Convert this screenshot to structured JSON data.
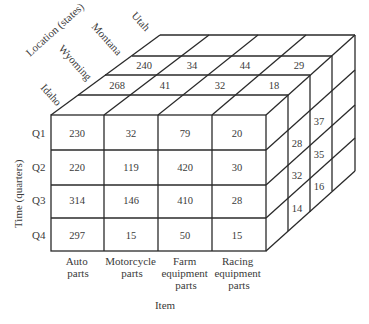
{
  "diagram": {
    "type": "data-cube",
    "axes": {
      "location": {
        "title": "Location (states)",
        "labels": [
          "Idaho",
          "Wyoming",
          "Montana",
          "Utah"
        ]
      },
      "time": {
        "title": "Time (quarters)",
        "labels": [
          "Q1",
          "Q2",
          "Q3",
          "Q4"
        ]
      },
      "item": {
        "title": "Item",
        "labels": [
          [
            "Auto",
            "parts"
          ],
          [
            "Motorcycle",
            "parts"
          ],
          [
            "Farm",
            "equipment",
            "parts"
          ],
          [
            "Racing",
            "equipment",
            "parts"
          ]
        ]
      }
    },
    "front_face": {
      "location": "Idaho",
      "rows": [
        [
          "230",
          "32",
          "79",
          "20"
        ],
        [
          "220",
          "119",
          "420",
          "30"
        ],
        [
          "314",
          "146",
          "410",
          "28"
        ],
        [
          "297",
          "15",
          "50",
          "15"
        ]
      ]
    },
    "top_face": {
      "wyoming_row": [
        "268",
        "41",
        "32",
        "18"
      ],
      "montana_row": [
        "240",
        "34",
        "44",
        "29"
      ]
    },
    "right_face": {
      "wyoming_column": [
        "28",
        "32",
        "14"
      ],
      "montana_column": [
        "37",
        "35",
        "16"
      ]
    }
  }
}
